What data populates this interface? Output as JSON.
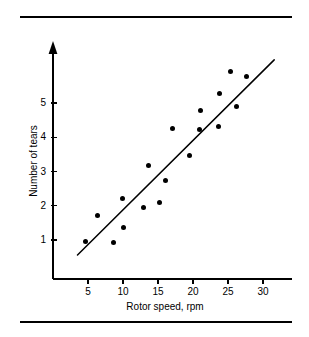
{
  "figure": {
    "background_color": "#ffffff",
    "foreground_color": "#000000",
    "top_rule": "",
    "bottom_rule": ""
  },
  "chart_data": {
    "type": "scatter",
    "title": "",
    "xlabel": "Rotor speed, rpm",
    "ylabel": "Number of tears",
    "xlim": [
      0,
      33
    ],
    "ylim": [
      0,
      6.3
    ],
    "xticks": [
      5,
      10,
      15,
      20,
      25,
      30
    ],
    "xtick_labels": [
      "5",
      "10",
      "15",
      "20",
      "25",
      "30"
    ],
    "yticks": [
      1,
      2,
      3,
      4,
      5
    ],
    "ytick_labels": [
      "1",
      "2",
      "3",
      "4",
      "5"
    ],
    "grid": false,
    "legend": null,
    "y_axis_arrow": true,
    "marker": "filled-circle",
    "marker_color": "#000000",
    "points": [
      {
        "x": 4.7,
        "y": 0.97
      },
      {
        "x": 6.3,
        "y": 1.72
      },
      {
        "x": 8.6,
        "y": 0.93
      },
      {
        "x": 9.9,
        "y": 2.21
      },
      {
        "x": 10.0,
        "y": 1.37
      },
      {
        "x": 12.9,
        "y": 1.95
      },
      {
        "x": 13.6,
        "y": 3.17
      },
      {
        "x": 15.2,
        "y": 2.09
      },
      {
        "x": 16.1,
        "y": 2.75
      },
      {
        "x": 17.1,
        "y": 4.25
      },
      {
        "x": 19.5,
        "y": 3.48
      },
      {
        "x": 20.9,
        "y": 4.24
      },
      {
        "x": 21.1,
        "y": 4.78
      },
      {
        "x": 23.6,
        "y": 4.3
      },
      {
        "x": 23.8,
        "y": 5.27
      },
      {
        "x": 25.4,
        "y": 5.92
      },
      {
        "x": 26.2,
        "y": 4.9
      },
      {
        "x": 27.6,
        "y": 5.77
      }
    ],
    "fit_line": {
      "type": "linear",
      "x_start": 3.5,
      "y_start": 0.56,
      "x_end": 31.6,
      "y_end": 6.26,
      "color": "#000000"
    }
  }
}
